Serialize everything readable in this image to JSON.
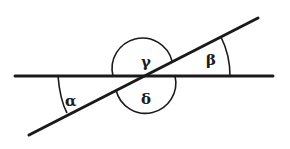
{
  "diagram": {
    "type": "intersecting-lines-angles",
    "lines": {
      "horizontal": {
        "x1": 15,
        "y1": 76,
        "x2": 273,
        "y2": 76
      },
      "transversal": {
        "x1": 29,
        "y1": 135,
        "x2": 258,
        "y2": 18
      }
    },
    "angles": [
      {
        "id": "alpha",
        "label": "α",
        "x": 65,
        "y": 106
      },
      {
        "id": "beta",
        "label": "β",
        "x": 206,
        "y": 65
      },
      {
        "id": "gamma",
        "label": "γ",
        "x": 141,
        "y": 67
      },
      {
        "id": "delta",
        "label": "δ",
        "x": 141,
        "y": 104
      }
    ],
    "colors": {
      "stroke": "#1a1a1a",
      "background": "#ffffff"
    }
  }
}
